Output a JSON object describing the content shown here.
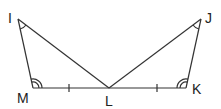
{
  "diagram": {
    "type": "geometry",
    "points": {
      "I": {
        "label": "I",
        "x": 18,
        "y": 19
      },
      "M": {
        "label": "M",
        "x": 33,
        "y": 88
      },
      "L": {
        "label": "L",
        "x": 109,
        "y": 88
      },
      "J": {
        "label": "J",
        "x": 201,
        "y": 19
      },
      "K": {
        "label": "K",
        "x": 186,
        "y": 88
      }
    },
    "segments": [
      "IM",
      "IL",
      "ML",
      "LK",
      "LJ",
      "JK"
    ],
    "marks": {
      "single_tick": [
        "ML",
        "LK"
      ],
      "single_arc": [
        "angle I",
        "angle J"
      ],
      "double_arc": [
        "angle M",
        "angle K"
      ]
    },
    "colors": {
      "stroke": "#333333",
      "text": "#222222",
      "background": "#ffffff"
    }
  }
}
